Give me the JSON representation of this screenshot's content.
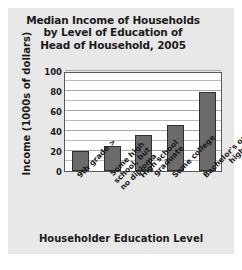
{
  "chart_data": {
    "type": "bar",
    "title": "Median Income of Households by Level of Education of Head of Household, 2005",
    "title_lines": [
      "Median Income of Households",
      "by Level of Education of",
      "Head of Household, 2005"
    ],
    "xlabel": "Householder Education Level",
    "ylabel": "Income (1000s of dollars)",
    "categories": [
      "< 9th grade",
      "Some high school, but no diploma",
      "High school graduate",
      "Some college",
      "Bachelor's or higher"
    ],
    "category_lines": [
      [
        "< 9th grade"
      ],
      [
        "Some high",
        "school, but",
        "no diploma"
      ],
      [
        "High school",
        "graduate"
      ],
      [
        "Some college"
      ],
      [
        "Bachelor's or",
        "higher"
      ]
    ],
    "values": [
      20,
      25,
      36,
      46,
      79
    ],
    "ylim": [
      0,
      100
    ],
    "yticks": [
      0,
      20,
      40,
      60,
      80,
      100
    ],
    "minor_tick_step": 10,
    "grid": true,
    "legend": "none",
    "colors": {
      "bar_fill": "#6b6b6b",
      "bar_border": "#2f2f2f",
      "plot_background": "#ffffff",
      "panel_background": "#e8e8e8",
      "gridline": "#b9b9b9",
      "text": "#1b1b1b"
    }
  }
}
